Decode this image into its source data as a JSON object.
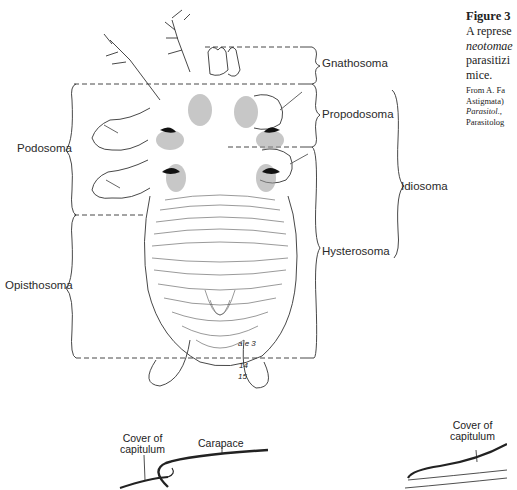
{
  "figure": {
    "title": "Figure 3",
    "caption_lines": [
      "A represe",
      "neotomae",
      "parasitizi",
      "mice."
    ],
    "source_lines": [
      "From A. Fa",
      "Astigmata)",
      "Parasitol.,",
      "Parasitolog"
    ]
  },
  "diagram": {
    "left_labels": {
      "podosoma": "Podosoma",
      "opisthosoma": "Opisthosoma"
    },
    "right_labels": {
      "gnathosoma": "Gnathosoma",
      "propodosoma": "Propodosoma",
      "hysterosoma": "Hysterosoma",
      "idiosoma": "Idiosoma"
    },
    "setae_labels": [
      "a e 3",
      "14",
      "15"
    ]
  },
  "lower_diagrams": {
    "left": {
      "cover_label": "Cover of\ncapitulum",
      "cover_line1": "Cover of",
      "cover_line2": "capitulum",
      "carapace_label": "Carapace"
    },
    "right": {
      "cover_line1": "Cover of",
      "cover_line2": "capitulum"
    }
  },
  "colors": {
    "ink": "#2a2a2a",
    "stipple": "#9a9a9a",
    "background": "#ffffff"
  }
}
